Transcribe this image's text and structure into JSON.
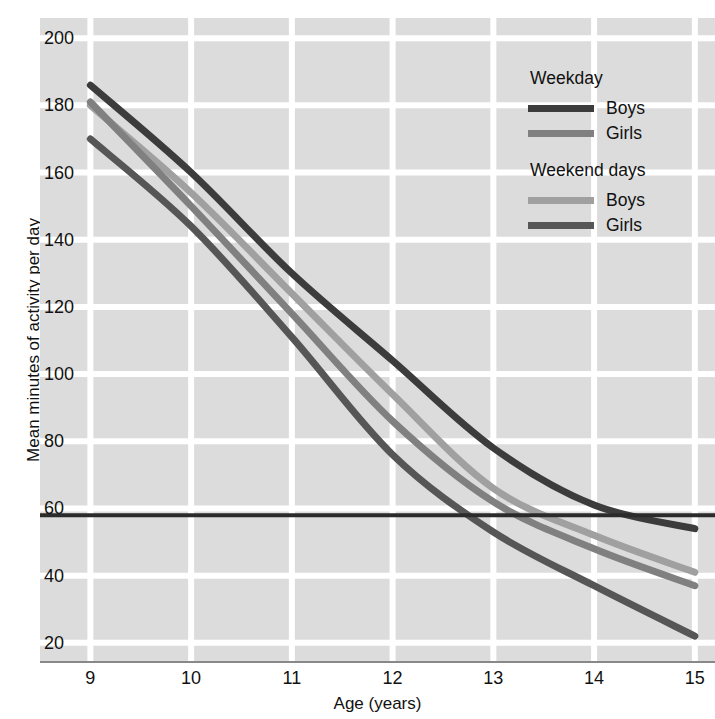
{
  "chart_data": {
    "type": "line",
    "title": "",
    "xlabel": "Age (years)",
    "ylabel": "Mean minutes of activity per day",
    "xlim": [
      8.5,
      15.2
    ],
    "ylim": [
      14,
      206
    ],
    "xticks": [
      9,
      10,
      11,
      12,
      13,
      14,
      15
    ],
    "yticks": [
      20,
      40,
      60,
      80,
      100,
      120,
      140,
      160,
      180,
      200
    ],
    "grid": true,
    "legend_position": "top-right",
    "x": [
      9,
      10,
      11,
      12,
      13,
      14,
      15
    ],
    "series": [
      {
        "name": "Weekday Boys",
        "group": "Weekday",
        "sex": "Boys",
        "color": "#3c3c3c",
        "values": [
          186,
          160,
          130,
          104,
          78,
          61,
          54
        ]
      },
      {
        "name": "Weekday Girls",
        "group": "Weekday",
        "sex": "Girls",
        "color": "#808080",
        "values": [
          181,
          150,
          118,
          86,
          62,
          48,
          37
        ]
      },
      {
        "name": "Weekend days Boys",
        "group": "Weekend days",
        "sex": "Boys",
        "color": "#a0a0a0",
        "values": [
          180,
          154,
          124,
          94,
          66,
          52,
          41
        ]
      },
      {
        "name": "Weekend days Girls",
        "group": "Weekend days",
        "sex": "Girls",
        "color": "#565656",
        "values": [
          170,
          144,
          111,
          76,
          53,
          37,
          22
        ]
      }
    ],
    "reference_line": {
      "name": "60-minute guideline",
      "orientation": "horizontal",
      "value": 58,
      "color": "#2b2b2b"
    },
    "legend": {
      "groups": [
        {
          "title": "Weekday",
          "entries": [
            {
              "label": "Boys",
              "color": "#3c3c3c"
            },
            {
              "label": "Girls",
              "color": "#808080"
            }
          ]
        },
        {
          "title": "Weekend days",
          "entries": [
            {
              "label": "Boys",
              "color": "#a0a0a0"
            },
            {
              "label": "Girls",
              "color": "#565656"
            }
          ]
        }
      ]
    },
    "style": {
      "plot_background": "#dcdcdc",
      "grid_color": "#ffffff",
      "axis_color": "#888888",
      "text_color": "#111111"
    }
  }
}
